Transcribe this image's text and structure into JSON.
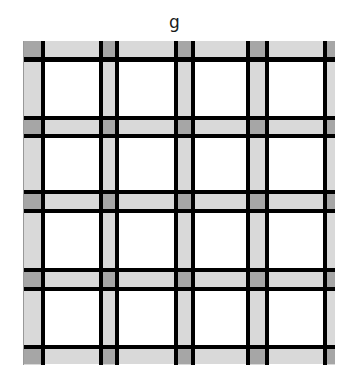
{
  "title": "g",
  "pattern": {
    "name": "plaid-grid",
    "colors": {
      "background": "#ffffff",
      "band": "#d9d9d9",
      "intersection": "#a6a6a6",
      "line": "#000000"
    },
    "origin": {
      "x": 23,
      "y": 41
    },
    "columns": [
      {
        "gray": [
          0,
          17
        ],
        "lines": [
          [
            17,
            21
          ]
        ]
      },
      {
        "gray": [
          79,
          91
        ],
        "lines": [
          [
            75,
            79
          ],
          [
            91,
            95
          ]
        ]
      },
      {
        "gray": [
          154,
          167
        ],
        "lines": [
          [
            150,
            154
          ],
          [
            167,
            171
          ]
        ]
      },
      {
        "gray": [
          226,
          241
        ],
        "lines": [
          [
            222,
            226
          ],
          [
            241,
            245
          ]
        ]
      },
      {
        "gray": [
          303,
          311
        ],
        "lines": [
          [
            299,
            303
          ]
        ]
      }
    ],
    "rows": [
      {
        "gray": [
          0,
          16
        ],
        "lines": [
          [
            16,
            21
          ]
        ]
      },
      {
        "gray": [
          79,
          93
        ],
        "lines": [
          [
            75,
            79
          ],
          [
            93,
            97
          ]
        ]
      },
      {
        "gray": [
          153,
          168
        ],
        "lines": [
          [
            149,
            153
          ],
          [
            168,
            172
          ]
        ]
      },
      {
        "gray": [
          231,
          246
        ],
        "lines": [
          [
            227,
            231
          ],
          [
            246,
            250
          ]
        ]
      },
      {
        "gray": [
          308,
          323
        ],
        "lines": [
          [
            304,
            308
          ]
        ]
      }
    ]
  }
}
